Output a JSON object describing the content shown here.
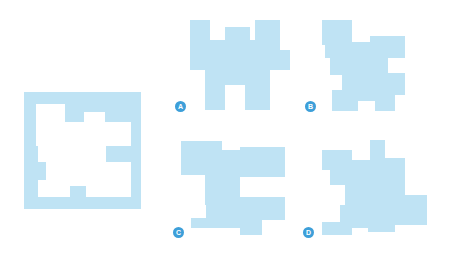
{
  "puzzle": {
    "description": "Which piece fits into the frame?",
    "frame_color": "#bfe3f4",
    "badge_color": "#3d9fd9",
    "options": [
      {
        "label": "A"
      },
      {
        "label": "B"
      },
      {
        "label": "C"
      },
      {
        "label": "D"
      }
    ]
  }
}
